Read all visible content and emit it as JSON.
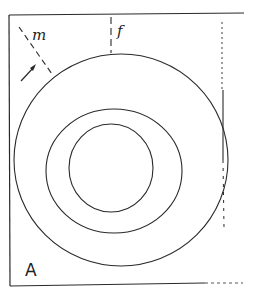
{
  "diagram": {
    "type": "concentric-circles-figure",
    "labels": {
      "m": "m",
      "f": "f",
      "panel": "A"
    },
    "colors": {
      "ink": "#2a2a2a",
      "background": "#ffffff"
    },
    "elements": [
      {
        "name": "outer-circle"
      },
      {
        "name": "middle-circle"
      },
      {
        "name": "inner-circle"
      },
      {
        "name": "dashed-line-m"
      },
      {
        "name": "dashed-line-f"
      },
      {
        "name": "dashed-line-right"
      },
      {
        "name": "arrow"
      }
    ]
  }
}
